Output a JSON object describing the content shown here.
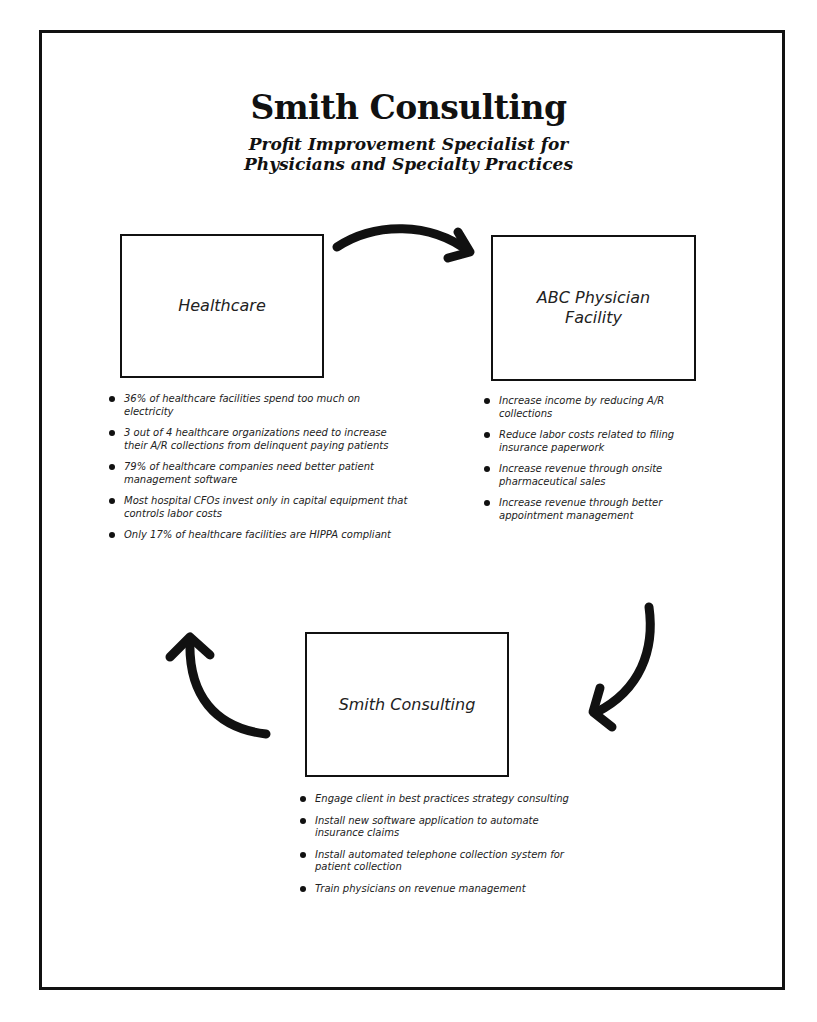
{
  "header": {
    "title": "Smith Consulting",
    "subtitle_lines": [
      "Profit Improvement Specialist for",
      "Physicians and Specialty Practices"
    ]
  },
  "diagram": {
    "nodes": [
      {
        "id": "healthcare",
        "label_lines": [
          "Healthcare"
        ],
        "bullets": [
          "36% of healthcare facilities spend too much on electricity",
          "3 out of 4 healthcare organizations need to increase their A/R collections from delinquent paying patients",
          "79% of healthcare companies need better patient management software",
          "Most hospital CFOs invest only in capital equipment that controls labor costs",
          "Only 17% of healthcare facilities are HIPPA compliant"
        ]
      },
      {
        "id": "abc-physician-facility",
        "label_lines": [
          "ABC Physician",
          "Facility"
        ],
        "bullets": [
          "Increase income by reducing A/R collections",
          "Reduce labor costs related to filing insurance paperwork",
          "Increase revenue through onsite pharmaceutical sales",
          "Increase revenue through better appointment management"
        ]
      },
      {
        "id": "smith-consulting",
        "label_lines": [
          "Smith Consulting"
        ],
        "bullets": [
          "Engage client in best practices strategy consulting",
          "Install new software application to automate insurance claims",
          "Install automated telephone collection system for patient collection",
          "Train physicians on revenue management"
        ]
      }
    ],
    "edges": [
      {
        "from": "healthcare",
        "to": "abc-physician-facility",
        "icon": "curved-arrow-right-icon"
      },
      {
        "from": "abc-physician-facility",
        "to": "smith-consulting",
        "icon": "curved-arrow-down-icon"
      },
      {
        "from": "smith-consulting",
        "to": "healthcare",
        "icon": "curved-arrow-up-icon"
      }
    ],
    "colors": {
      "stroke": "#111111",
      "background": "#ffffff",
      "text": "#222222"
    }
  }
}
